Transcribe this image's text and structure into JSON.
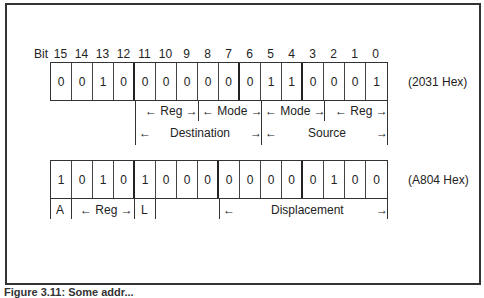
{
  "figure": {
    "bit_label": "Bit",
    "bit_numbers": [
      "15",
      "14",
      "13",
      "12",
      "11",
      "10",
      "9",
      "8",
      "7",
      "6",
      "5",
      "4",
      "3",
      "2",
      "1",
      "0"
    ],
    "instruction1": {
      "bits": [
        "0",
        "0",
        "1",
        "0",
        "0",
        "0",
        "0",
        "0",
        "0",
        "0",
        "1",
        "1",
        "0",
        "0",
        "0",
        "1"
      ],
      "hex_label": "(2031 Hex)",
      "fields_row1": [
        {
          "label": "← Reg →",
          "bits": "11-9"
        },
        {
          "label": "← Mode →",
          "bits": "8-6"
        },
        {
          "label": "← Mode →",
          "bits": "5-3"
        },
        {
          "label": "← Reg →",
          "bits": "2-0"
        }
      ],
      "fields_row2": [
        {
          "label": "Destination",
          "left_arrow": "←",
          "right_arrow": "→",
          "bits": "11-6"
        },
        {
          "label": "Source",
          "left_arrow": "←",
          "right_arrow": "→",
          "bits": "5-0"
        }
      ]
    },
    "instruction2": {
      "bits": [
        "1",
        "0",
        "1",
        "0",
        "1",
        "0",
        "0",
        "0",
        "0",
        "0",
        "0",
        "0",
        "0",
        "1",
        "0",
        "0"
      ],
      "hex_label": "(A804 Hex)",
      "fields": [
        {
          "label": "A",
          "bits": "15"
        },
        {
          "label": "← Reg →",
          "bits": "14-12"
        },
        {
          "label": "L",
          "bits": "11"
        },
        {
          "label": "Displacement",
          "left_arrow": "←",
          "right_arrow": "→",
          "bits": "7-0"
        }
      ]
    },
    "caption": "Figure 3.11: Some addr..."
  }
}
